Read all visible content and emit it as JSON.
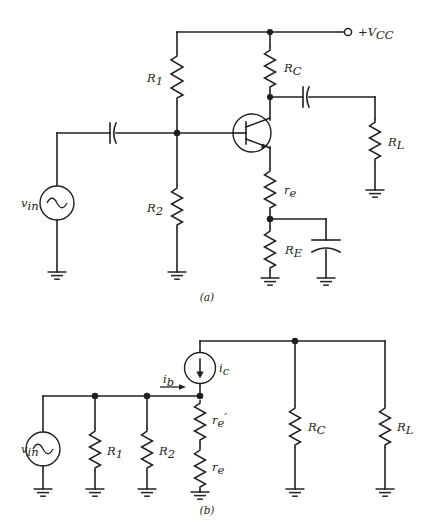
{
  "figure": {
    "background_color": "#ffffff",
    "line_color": "#231f20",
    "captions": [
      {
        "id": "caption-a",
        "text": "(a)"
      },
      {
        "id": "caption-b",
        "text": "(b)"
      }
    ]
  },
  "panel_a": {
    "caption": "(a)",
    "supply": {
      "label": "+V",
      "subscript": "CC",
      "terminal_type": "open-circle"
    },
    "source": {
      "label": "v",
      "subscript": "in",
      "type": "ac-sine-source"
    },
    "components": [
      {
        "name": "R1",
        "label": "R",
        "subscript": "1",
        "type": "resistor"
      },
      {
        "name": "R2",
        "label": "R",
        "subscript": "2",
        "type": "resistor"
      },
      {
        "name": "RC",
        "label": "R",
        "subscript": "C",
        "type": "resistor"
      },
      {
        "name": "RE",
        "label": "R",
        "subscript": "E",
        "type": "resistor"
      },
      {
        "name": "RL",
        "label": "R",
        "subscript": "L",
        "type": "resistor"
      },
      {
        "name": "re",
        "label": "r",
        "subscript": "e",
        "type": "resistor"
      },
      {
        "name": "C-input",
        "label": "",
        "subscript": "",
        "type": "capacitor-vertical-plates"
      },
      {
        "name": "C-output",
        "label": "",
        "subscript": "",
        "type": "capacitor-vertical-plates"
      },
      {
        "name": "C-bypass",
        "label": "",
        "subscript": "",
        "type": "capacitor-horizontal-plates"
      },
      {
        "name": "Q1",
        "label": "",
        "subscript": "",
        "type": "npn-transistor"
      }
    ],
    "ground_count": 5
  },
  "panel_b": {
    "caption": "(b)",
    "source": {
      "label": "v",
      "subscript": "in",
      "type": "ac-sine-source"
    },
    "current_source": {
      "label": "i",
      "subscript": "c",
      "type": "current-source",
      "arrow_direction": "down"
    },
    "base_current": {
      "label": "i",
      "subscript": "b",
      "arrow_direction": "right"
    },
    "components": [
      {
        "name": "R1",
        "label": "R",
        "subscript": "1",
        "type": "resistor"
      },
      {
        "name": "R2",
        "label": "R",
        "subscript": "2",
        "type": "resistor"
      },
      {
        "name": "re-prime",
        "label": "r",
        "subscript": "e",
        "prime": "′",
        "type": "resistor"
      },
      {
        "name": "re",
        "label": "r",
        "subscript": "e",
        "type": "resistor"
      },
      {
        "name": "RC",
        "label": "R",
        "subscript": "C",
        "type": "resistor"
      },
      {
        "name": "RL",
        "label": "R",
        "subscript": "L",
        "type": "resistor"
      }
    ],
    "ground_count": 6
  }
}
